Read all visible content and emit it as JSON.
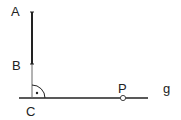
{
  "diagram": {
    "labels": {
      "A": "A",
      "B": "B",
      "C": "C",
      "P": "P",
      "g": "g"
    },
    "colors": {
      "line": "#222222",
      "background": "#ffffff"
    },
    "right_angle_dot": "·"
  }
}
